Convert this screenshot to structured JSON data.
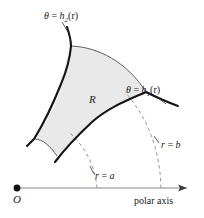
{
  "figure": {
    "colors": {
      "region_fill": "#e9e9e9",
      "thick_curve": "#1a1a1a",
      "thin_arc": "#4d4d4d",
      "dashed_arc": "#808080",
      "axis": "#8a8a8a",
      "text": "#1a1a1a"
    }
  },
  "labels": {
    "theta_h2": {
      "theta": "θ",
      "equals": " = ",
      "fn": "h",
      "sub": "2",
      "arg": "(r)"
    },
    "theta_h1": {
      "theta": "θ",
      "equals": " = ",
      "fn": "h",
      "sub": "1",
      "arg": "(r)"
    },
    "r_equals_a": {
      "var": "r",
      "equals": " = ",
      "value": "a"
    },
    "r_equals_b": {
      "var": "r",
      "equals": " = ",
      "value": "b"
    },
    "region": "R",
    "origin": "O",
    "polar_axis": "polar axis"
  }
}
